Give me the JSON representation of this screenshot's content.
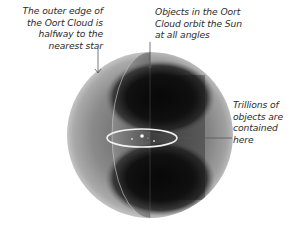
{
  "diagram": {
    "subject": "Oort Cloud",
    "annotations": [
      {
        "id": "outer-edge",
        "text": "The outer edge of the Oort Cloud is halfway to the nearest star",
        "lines": [
          "The outer edge of",
          "the Oort Cloud is",
          "halfway to the",
          "nearest star"
        ]
      },
      {
        "id": "orbit-angles",
        "text": "Objects in the Oort Cloud orbit the Sun at all angles",
        "lines": [
          "Objects in the Oort",
          "Cloud orbit the Sun",
          "at all angles"
        ]
      },
      {
        "id": "trillions",
        "text": "Trillions of objects are contained here",
        "lines": [
          "Trillions of",
          "objects are",
          "contained",
          "here"
        ]
      }
    ],
    "colors": {
      "sphere_outer": "#b8b8b8",
      "sphere_shell": "#8c8c8c",
      "cutaway_dark": "#151515",
      "ring": "#f2f2f2",
      "text": "#2b2b2b",
      "pointer": "#555555"
    }
  }
}
